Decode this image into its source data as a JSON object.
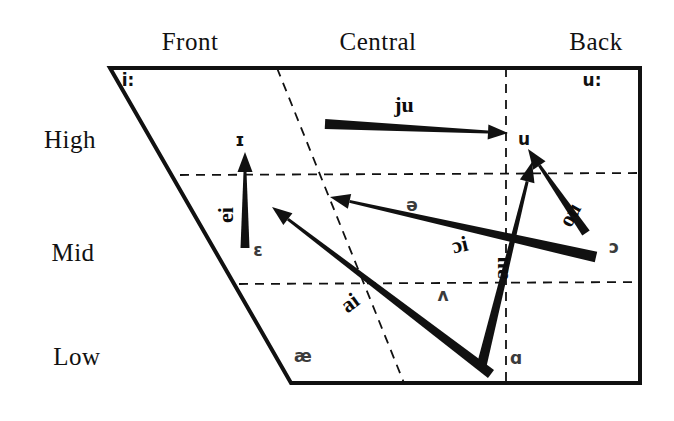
{
  "figure": {
    "background_color": "#ffffff",
    "line_color": "#111111",
    "symbol_color": "#3b3b3b"
  },
  "axes": {
    "backness_labels": [
      {
        "text": "Front",
        "x": 190,
        "y": 42
      },
      {
        "text": "Central",
        "x": 378,
        "y": 42
      },
      {
        "text": "Back",
        "x": 596,
        "y": 42
      }
    ],
    "height_labels": [
      {
        "text": "High",
        "x": 70,
        "y": 140
      },
      {
        "text": "Mid",
        "x": 73,
        "y": 253
      },
      {
        "text": "Low",
        "x": 77,
        "y": 357
      }
    ]
  },
  "quadrilateral": {
    "points": "110,68 640,68 640,383 291,383",
    "stroke_width": 4
  },
  "dividers": [
    {
      "name": "high-mid-boundary",
      "x1": 180,
      "y1": 175,
      "x2": 640,
      "y2": 173,
      "orientation": "horizontal"
    },
    {
      "name": "mid-low-boundary",
      "x1": 239,
      "y1": 284,
      "x2": 640,
      "y2": 282,
      "orientation": "horizontal"
    },
    {
      "name": "front-central-boundary",
      "x1": 277,
      "y1": 68,
      "x2": 404,
      "y2": 383,
      "orientation": "slanted"
    },
    {
      "name": "central-back-boundary",
      "x1": 506,
      "y1": 68,
      "x2": 506,
      "y2": 383,
      "orientation": "vertical"
    }
  ],
  "vowels": [
    {
      "symbol": "i:",
      "x": 128,
      "y": 80,
      "tone": "dark"
    },
    {
      "symbol": "u:",
      "x": 592,
      "y": 80,
      "tone": "dark"
    },
    {
      "symbol": "ɪ",
      "x": 240,
      "y": 140,
      "tone": "dark"
    },
    {
      "symbol": "u",
      "x": 524,
      "y": 139,
      "tone": "dark"
    },
    {
      "symbol": "ə",
      "x": 412,
      "y": 205,
      "tone": "gray"
    },
    {
      "symbol": "ɔ",
      "x": 614,
      "y": 247,
      "tone": "gray"
    },
    {
      "symbol": "ɛ",
      "x": 258,
      "y": 250,
      "tone": "gray"
    },
    {
      "symbol": "ʌ",
      "x": 443,
      "y": 295,
      "tone": "gray"
    },
    {
      "symbol": "æ",
      "x": 303,
      "y": 356,
      "tone": "gray"
    },
    {
      "symbol": "ɑ",
      "x": 516,
      "y": 358,
      "tone": "gray"
    }
  ],
  "diphthongs": [
    {
      "name": "ju",
      "label": "ju",
      "label_x": 404,
      "label_y": 105,
      "label_rotation": 0,
      "tail": {
        "x": 325,
        "y": 124
      },
      "head": {
        "x": 508,
        "y": 133
      },
      "tail_width": 10,
      "head_width": 3,
      "gloss": "glide from palatal onglide to back high rounded"
    },
    {
      "name": "ei",
      "label": "ei",
      "label_x": 226,
      "label_y": 215,
      "label_rotation": -90,
      "tail": {
        "x": 245,
        "y": 248
      },
      "head": {
        "x": 245,
        "y": 152
      },
      "tail_width": 9,
      "head_width": 3,
      "gloss": "glide from mid front to high front"
    },
    {
      "name": "ou",
      "label": "ou",
      "label_x": 570,
      "label_y": 215,
      "label_rotation": -62,
      "tail": {
        "x": 586,
        "y": 233
      },
      "head": {
        "x": 528,
        "y": 149
      },
      "tail_width": 9,
      "head_width": 3,
      "gloss": "glide from mid back to high back"
    },
    {
      "name": "ɔi",
      "label": "ɔi",
      "label_x": 460,
      "label_y": 245,
      "label_rotation": -13,
      "tail": {
        "x": 596,
        "y": 257
      },
      "head": {
        "x": 330,
        "y": 197
      },
      "tail_width": 11,
      "head_width": 3,
      "gloss": "glide from mid back rounded to high front"
    },
    {
      "name": "ai",
      "label": "ai",
      "label_x": 350,
      "label_y": 303,
      "label_rotation": -36,
      "tail": {
        "x": 491,
        "y": 374
      },
      "head": {
        "x": 272,
        "y": 207
      },
      "tail_width": 10,
      "head_width": 3,
      "gloss": "glide from low central to high front"
    },
    {
      "name": "au",
      "label": "au",
      "label_x": 501,
      "label_y": 268,
      "label_rotation": -90,
      "tail": {
        "x": 481,
        "y": 368
      },
      "head": {
        "x": 532,
        "y": 162
      },
      "tail_width": 10,
      "head_width": 3,
      "gloss": "glide from low central to high back rounded"
    }
  ]
}
